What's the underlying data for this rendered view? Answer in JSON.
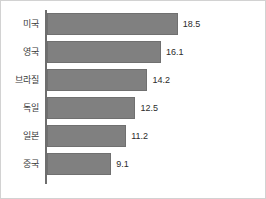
{
  "chart_data": {
    "type": "bar",
    "orientation": "horizontal",
    "title": "",
    "subtitle": "",
    "xlabel": "",
    "ylabel": "",
    "categories": [
      "미국",
      "영국",
      "브라질",
      "독일",
      "일본",
      "중국"
    ],
    "values": [
      18.5,
      16.1,
      14.2,
      12.5,
      11.2,
      9.1
    ],
    "value_labels": [
      "18.5",
      "16.1",
      "14.2",
      "12.5",
      "11.2",
      "9.1"
    ],
    "series": [
      {
        "name": "",
        "values": [
          18.5,
          16.1,
          14.2,
          12.5,
          11.2,
          9.1
        ]
      }
    ],
    "xlim": [
      0,
      20.5
    ],
    "ylim": null,
    "grid": false,
    "legend": false,
    "legend_position": "none",
    "bar_color": "#808080",
    "bar_border_color": "#707070",
    "axis_color": "#6e6e6e",
    "frame_color": "#d2d2d2",
    "label_color": "#3a3a3a",
    "value_color": "#2b2b2b",
    "background": "#ffffff",
    "annotations": []
  }
}
